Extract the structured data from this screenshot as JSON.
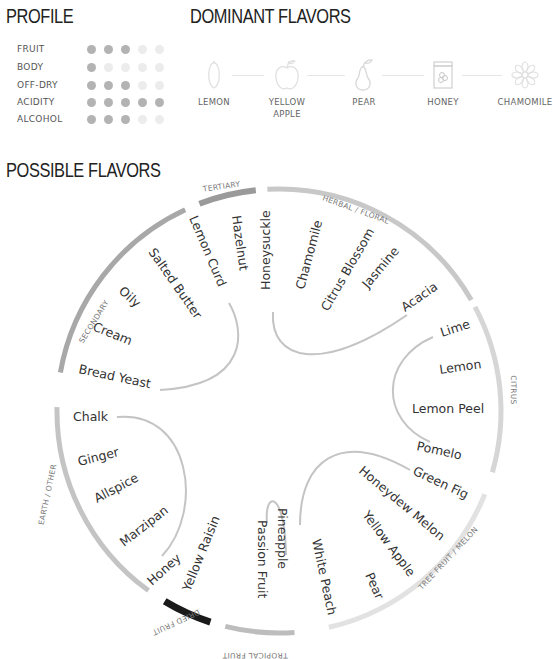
{
  "profile": {
    "title": "PROFILE",
    "max": 5,
    "rows": [
      {
        "label": "FRUIT",
        "value": 3
      },
      {
        "label": "BODY",
        "value": 1
      },
      {
        "label": "OFF-DRY",
        "value": 3
      },
      {
        "label": "ACIDITY",
        "value": 5
      },
      {
        "label": "ALCOHOL",
        "value": 3
      }
    ]
  },
  "dominant": {
    "title": "DOMINANT FLAVORS",
    "items": [
      {
        "label": "LEMON",
        "icon": "lemon-icon"
      },
      {
        "label": "YELLOW APPLE",
        "icon": "apple-icon"
      },
      {
        "label": "PEAR",
        "icon": "pear-icon"
      },
      {
        "label": "HONEY",
        "icon": "honey-jar-icon"
      },
      {
        "label": "CHAMOMILE",
        "icon": "flower-icon"
      }
    ]
  },
  "possible": {
    "title": "POSSIBLE FLAVORS",
    "categories": [
      {
        "name": "SECONDARY",
        "color": "#a8a8a8",
        "flavors": [
          "Bread Yeast",
          "Cream",
          "Oily",
          "Salted Butter",
          "Lemon Curd"
        ]
      },
      {
        "name": "TERTIARY",
        "color": "#9a9a9a",
        "flavors": [
          "Hazelnut"
        ]
      },
      {
        "name": "HERBAL / FLORAL",
        "color": "#c8c8c8",
        "flavors": [
          "Honeysuckle",
          "Chamomile",
          "Citrus Blossom",
          "Jasmine",
          "Acacia"
        ]
      },
      {
        "name": "CITRUS",
        "color": "#d6d6d6",
        "flavors": [
          "Lime",
          "Lemon",
          "Lemon Peel",
          "Pomelo"
        ]
      },
      {
        "name": "TREE FRUIT / MELON",
        "color": "#e2e2e2",
        "flavors": [
          "Green Fig",
          "Honeydew Melon",
          "Yellow Apple",
          "Pear",
          "White Peach"
        ]
      },
      {
        "name": "TROPICAL FRUIT",
        "color": "#bdbdbd",
        "flavors": [
          "Pineapple",
          "Passion Fruit"
        ]
      },
      {
        "name": "DRIED FRUIT",
        "color": "#1a1a1a",
        "flavors": [
          "Yellow Raisin"
        ]
      },
      {
        "name": "EARTH / OTHER",
        "color": "#c4c4c4",
        "flavors": [
          "Honey",
          "Marzipan",
          "Allspice",
          "Ginger",
          "Chalk"
        ]
      }
    ]
  }
}
